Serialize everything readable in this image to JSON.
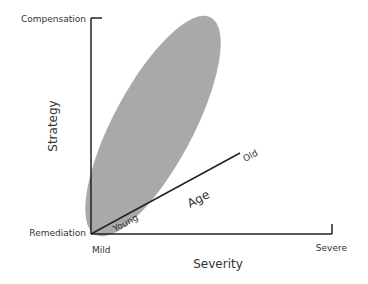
{
  "diagram": {
    "y_axis": {
      "label": "Strategy",
      "top_label": "Compensation",
      "bottom_label": "Remediation"
    },
    "x_axis": {
      "label": "Severity",
      "left_label": "Mild",
      "right_label": "Severe"
    },
    "z_axis": {
      "label": "Age",
      "start_label": "Young",
      "end_label": "Old"
    },
    "colors": {
      "ellipse": "#a9a9a9",
      "axis": "#222222"
    }
  }
}
